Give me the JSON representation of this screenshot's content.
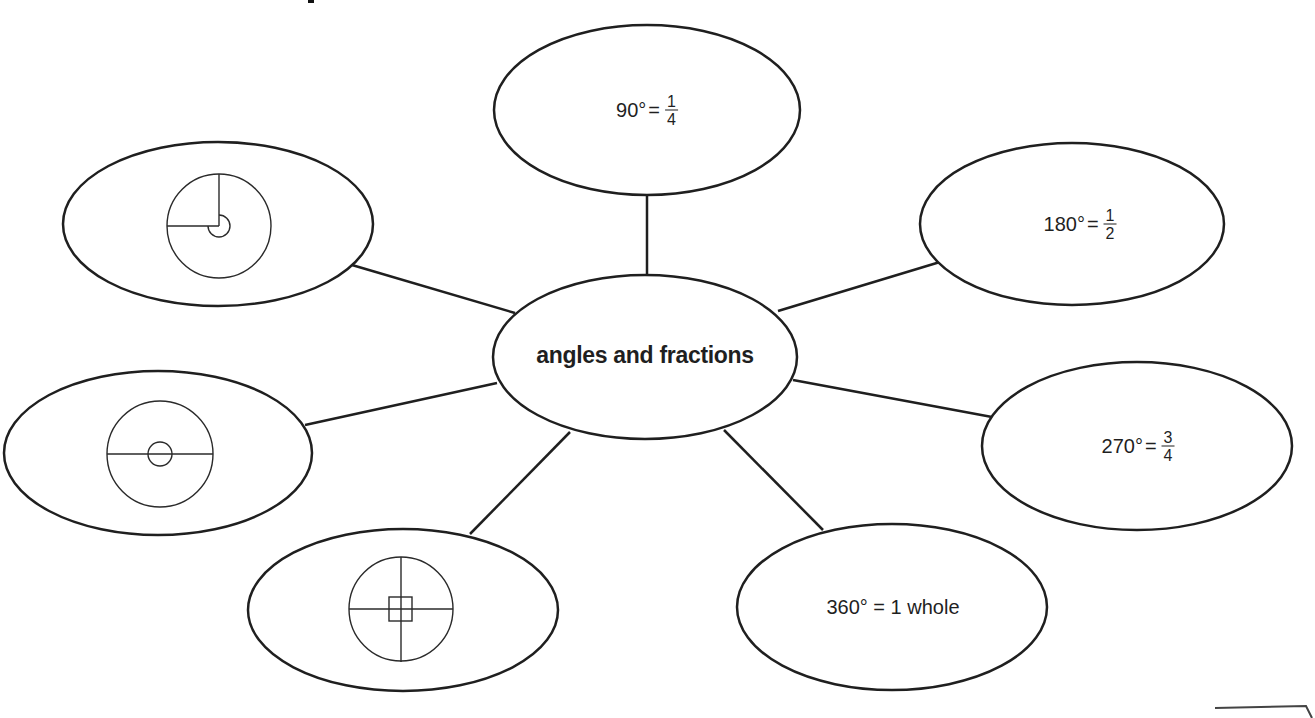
{
  "page": {
    "title_fragment": "",
    "background": "#ffffff",
    "stroke_color": "#1f1f1f"
  },
  "concept_map": {
    "center": {
      "label": "angles and fractions"
    },
    "nodes": [
      {
        "id": "top",
        "degrees": "90°",
        "equals": "=",
        "fraction_num": "1",
        "fraction_den": "4"
      },
      {
        "id": "top-right",
        "degrees": "180°",
        "equals": "=",
        "fraction_num": "1",
        "fraction_den": "2"
      },
      {
        "id": "right",
        "degrees": "270°",
        "equals": "=",
        "fraction_num": "3",
        "fraction_den": "4"
      },
      {
        "id": "bottom-right",
        "text": "360° = 1 whole"
      },
      {
        "id": "bottom-left",
        "diagram": "full-turn-circle-with-square-right-angle"
      },
      {
        "id": "left",
        "diagram": "half-turn-circle-with-straight-angle"
      },
      {
        "id": "top-left",
        "diagram": "three-quarter-turn-circle-with-reflex-angle"
      }
    ]
  }
}
